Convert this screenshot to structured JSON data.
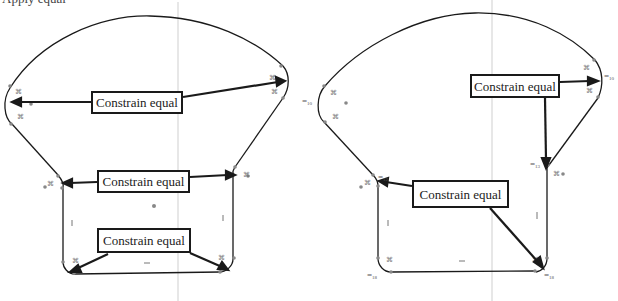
{
  "figure": {
    "caption_cut": "Apply equal",
    "panels": [
      {
        "id": "left",
        "callouts": [
          {
            "label": "Constrain equal",
            "x": 91,
            "y": 91,
            "w": 92,
            "h": 23
          },
          {
            "label": "Constrain equal",
            "x": 97,
            "y": 170,
            "w": 93,
            "h": 23
          },
          {
            "label": "Constrain equal",
            "x": 97,
            "y": 228,
            "w": 94,
            "h": 25
          }
        ]
      },
      {
        "id": "right",
        "callouts": [
          {
            "label": "Constrain equal",
            "x": 470,
            "y": 74,
            "w": 90,
            "h": 24
          },
          {
            "label": "Constrain equal",
            "x": 412,
            "y": 180,
            "w": 97,
            "h": 28
          }
        ],
        "equal_markers": [
          {
            "symbol": "=",
            "sub": "10",
            "x": 302,
            "y": 97
          },
          {
            "symbol": "=",
            "sub": "10",
            "x": 604,
            "y": 72
          },
          {
            "symbol": "=",
            "sub": "12",
            "x": 378,
            "y": 173
          },
          {
            "symbol": "=",
            "sub": "13",
            "x": 530,
            "y": 160
          },
          {
            "symbol": "=",
            "sub": "18",
            "x": 367,
            "y": 270
          },
          {
            "symbol": "=",
            "sub": "18",
            "x": 544,
            "y": 270
          }
        ]
      }
    ],
    "colors": {
      "stroke": "#1a1a1a",
      "axis": "#c8c8c8",
      "point": "#888888",
      "constraint_glyph": "#777777"
    }
  }
}
